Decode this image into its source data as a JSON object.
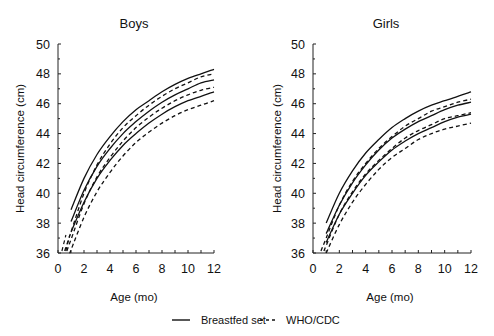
{
  "legend": {
    "solid_label": "Breastfed set",
    "dashed_label": "WHO/CDC"
  },
  "chart_data": [
    {
      "type": "line",
      "title": "Boys",
      "xlabel": "Age (mo)",
      "ylabel": "Head circumference (cm)",
      "xlim": [
        0,
        12
      ],
      "ylim": [
        36,
        50
      ],
      "xticks": [
        0,
        2,
        4,
        6,
        8,
        10,
        12
      ],
      "yticks": [
        36,
        38,
        40,
        42,
        44,
        46,
        48,
        50
      ],
      "grid": false,
      "legend_position": "bottom",
      "x": [
        1,
        2,
        3,
        4,
        5,
        6,
        7,
        8,
        9,
        10,
        11,
        12
      ],
      "series": [
        {
          "name": "Breastfed set (upper)",
          "style": "solid",
          "values": [
            38.9,
            41.0,
            42.6,
            43.8,
            44.8,
            45.6,
            46.2,
            46.8,
            47.3,
            47.7,
            48.0,
            48.3
          ]
        },
        {
          "name": "Breastfed set (middle)",
          "style": "solid",
          "values": [
            38.1,
            40.2,
            41.8,
            43.0,
            44.0,
            44.8,
            45.5,
            46.1,
            46.6,
            47.0,
            47.4,
            47.6
          ]
        },
        {
          "name": "Breastfed set (lower)",
          "style": "solid",
          "values": [
            37.4,
            39.4,
            41.0,
            42.2,
            43.2,
            44.0,
            44.7,
            45.3,
            45.8,
            46.2,
            46.5,
            46.8
          ]
        },
        {
          "name": "WHO/CDC (upper)",
          "style": "dashed",
          "values": [
            37.4,
            40.0,
            41.9,
            43.3,
            44.4,
            45.2,
            45.9,
            46.5,
            47.0,
            47.4,
            47.8,
            48.0
          ]
        },
        {
          "name": "WHO/CDC (middle)",
          "style": "dashed",
          "values": [
            36.9,
            39.3,
            41.1,
            42.4,
            43.5,
            44.4,
            45.1,
            45.7,
            46.2,
            46.6,
            46.9,
            47.1
          ]
        },
        {
          "name": "WHO/CDC (lower)",
          "style": "dashed",
          "values": [
            36.2,
            38.4,
            40.1,
            41.4,
            42.5,
            43.4,
            44.1,
            44.7,
            45.2,
            45.6,
            45.9,
            46.2
          ]
        }
      ],
      "extra_dashed_start": [
        {
          "x": 0.3,
          "y": 36.0
        },
        {
          "x": 0.6,
          "y": 36.0
        }
      ]
    },
    {
      "type": "line",
      "title": "Girls",
      "xlabel": "Age (mo)",
      "ylabel": "Head circumference (cm)",
      "xlim": [
        0,
        12
      ],
      "ylim": [
        36,
        50
      ],
      "xticks": [
        0,
        2,
        4,
        6,
        8,
        10,
        12
      ],
      "yticks": [
        36,
        38,
        40,
        42,
        44,
        46,
        48,
        50
      ],
      "grid": false,
      "legend_position": "bottom",
      "x": [
        1,
        2,
        3,
        4,
        5,
        6,
        7,
        8,
        9,
        10,
        11,
        12
      ],
      "series": [
        {
          "name": "Breastfed set (upper)",
          "style": "solid",
          "values": [
            38.0,
            40.0,
            41.5,
            42.7,
            43.6,
            44.4,
            45.0,
            45.5,
            45.9,
            46.2,
            46.5,
            46.8
          ]
        },
        {
          "name": "Breastfed set (middle)",
          "style": "solid",
          "values": [
            37.3,
            39.2,
            40.7,
            41.9,
            42.9,
            43.7,
            44.3,
            44.8,
            45.2,
            45.6,
            45.9,
            46.1
          ]
        },
        {
          "name": "Breastfed set (lower)",
          "style": "solid",
          "values": [
            36.7,
            38.6,
            40.0,
            41.2,
            42.1,
            42.9,
            43.5,
            44.0,
            44.4,
            44.8,
            45.1,
            45.3
          ]
        },
        {
          "name": "WHO/CDC (upper)",
          "style": "dashed",
          "values": [
            37.0,
            39.2,
            40.8,
            42.0,
            43.0,
            43.8,
            44.5,
            45.0,
            45.5,
            45.8,
            46.1,
            46.3
          ]
        },
        {
          "name": "WHO/CDC (middle)",
          "style": "dashed",
          "values": [
            36.5,
            38.6,
            40.1,
            41.3,
            42.2,
            43.0,
            43.7,
            44.2,
            44.6,
            45.0,
            45.2,
            45.4
          ]
        },
        {
          "name": "WHO/CDC (lower)",
          "style": "dashed",
          "values": [
            36.0,
            37.9,
            39.4,
            40.6,
            41.6,
            42.4,
            43.0,
            43.6,
            44.0,
            44.3,
            44.5,
            44.7
          ]
        }
      ]
    }
  ]
}
